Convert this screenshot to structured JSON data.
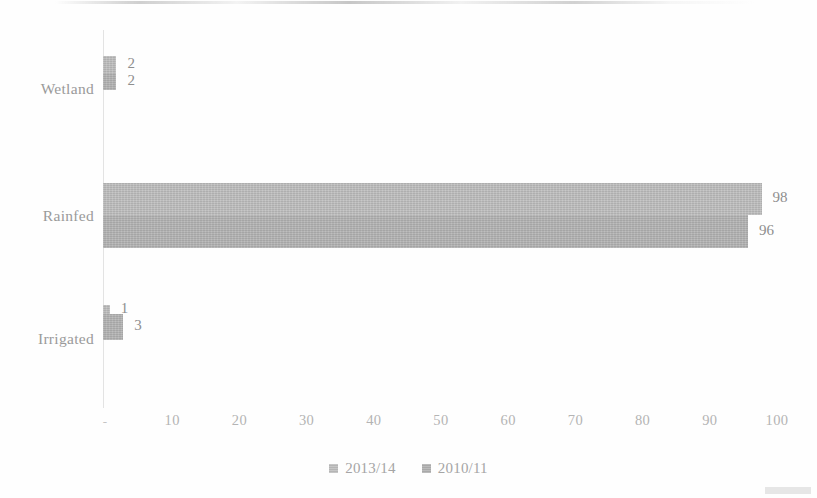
{
  "chart_data": {
    "type": "bar",
    "orientation": "horizontal",
    "title": "",
    "subtitle": "",
    "xlabel": "",
    "ylabel": "",
    "categories": [
      "Wetland",
      "Rainfed",
      "Irrigated"
    ],
    "series": [
      {
        "name": "2013/14",
        "values": [
          2,
          98,
          1
        ],
        "color": "#bdbdbd"
      },
      {
        "name": "2010/11",
        "values": [
          2,
          96,
          3
        ],
        "color": "#b2b2b2"
      }
    ],
    "data_labels": [
      "2",
      "2",
      "98",
      "96",
      "1",
      "3"
    ],
    "xlim": [
      0,
      100
    ],
    "xticks": [
      0,
      10,
      20,
      30,
      40,
      50,
      60,
      70,
      80,
      90,
      100
    ],
    "xtick_labels": [
      "-",
      "10",
      "20",
      "30",
      "40",
      "50",
      "60",
      "70",
      "80",
      "90",
      "100"
    ],
    "grid": false,
    "legend_position": "bottom",
    "axis_color": "#e3e3e3",
    "text_color": "#a5a5a5"
  },
  "axis": {
    "ticks": [
      {
        "label": "-",
        "value": 0
      },
      {
        "label": "10",
        "value": 10
      },
      {
        "label": "20",
        "value": 20
      },
      {
        "label": "30",
        "value": 30
      },
      {
        "label": "40",
        "value": 40
      },
      {
        "label": "50",
        "value": 50
      },
      {
        "label": "60",
        "value": 60
      },
      {
        "label": "70",
        "value": 70
      },
      {
        "label": "80",
        "value": 80
      },
      {
        "label": "90",
        "value": 90
      },
      {
        "label": "100",
        "value": 100
      }
    ]
  },
  "categories": [
    {
      "label": "Wetland",
      "v2013": 2,
      "v2010": 2,
      "l2013": "2",
      "l2010": "2"
    },
    {
      "label": "Rainfed",
      "v2013": 98,
      "v2010": 96,
      "l2013": "98",
      "l2010": "96"
    },
    {
      "label": "Irrigated",
      "v2013": 1,
      "v2010": 3,
      "l2013": "1",
      "l2010": "3"
    }
  ],
  "legend": {
    "items": [
      {
        "label": "2013/14",
        "color": "#bdbdbd"
      },
      {
        "label": "2010/11",
        "color": "#b2b2b2"
      }
    ]
  }
}
